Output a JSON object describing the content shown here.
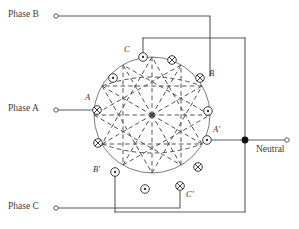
{
  "diagram": {
    "canvas": {
      "width": 299,
      "height": 229
    },
    "colors": {
      "wire": "#5a5a5a",
      "circle_outline": "#6e6e6e",
      "dashed_coil": "#4a4a4a",
      "node_stroke": "#3a3a3a",
      "text": "#3b3b3b",
      "junction_fill": "#111111",
      "background": "#ffffff"
    },
    "terminals": [
      {
        "name": "phase-b",
        "label": "Phase B",
        "label_x": 8,
        "label_y": 12,
        "dot_x": 55,
        "dot_y": 16
      },
      {
        "name": "phase-a",
        "label": "Phase A",
        "label_x": 8,
        "label_y": 106,
        "dot_x": 55,
        "dot_y": 110
      },
      {
        "name": "phase-c",
        "label": "Phase C",
        "label_x": 8,
        "label_y": 204,
        "dot_x": 55,
        "dot_y": 208
      },
      {
        "name": "neutral",
        "label": "Neutral",
        "label_x": 258,
        "label_y": 148,
        "dot_x": 288,
        "dot_y": 140
      }
    ],
    "node_labels": [
      {
        "name": "coil-label-C-top",
        "text": "C",
        "x": 124,
        "y": 51
      },
      {
        "name": "coil-label-B-right",
        "text": "B",
        "x": 211,
        "y": 71
      },
      {
        "name": "coil-label-A-left",
        "text": "A",
        "x": 87,
        "y": 94
      },
      {
        "name": "coil-label-A-prime",
        "text": "A'",
        "x": 222,
        "y": 127
      },
      {
        "name": "coil-label-B-prime",
        "text": "B'",
        "x": 95,
        "y": 172
      },
      {
        "name": "coil-label-C-bottom",
        "text": "C'",
        "x": 183,
        "y": 199
      }
    ],
    "stator": {
      "center_x": 152,
      "center_y": 115,
      "radius": 58,
      "slot_count": 12,
      "slot_symbols": [
        "dot",
        "cross",
        "dot",
        "cross",
        "dot",
        "cross",
        "dot",
        "cross",
        "dot",
        "cross",
        "dot",
        "cross"
      ],
      "slot_radius": 4.2
    },
    "junction": {
      "name": "neutral-junction",
      "x": 245,
      "y": 140,
      "radius": 3.4
    }
  }
}
